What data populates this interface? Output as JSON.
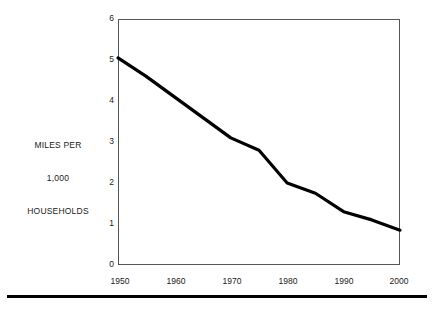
{
  "chart_data": {
    "type": "line",
    "title": "",
    "subtitle": "",
    "xlabel": "",
    "ylabel": "MILES PER 1,000 HOUSEHOLDS",
    "ylabel_lines": [
      "MILES PER",
      "1,000",
      "HOUSEHOLDS"
    ],
    "x": [
      1950,
      1955,
      1960,
      1965,
      1970,
      1975,
      1980,
      1985,
      1990,
      1995,
      2000
    ],
    "values": [
      5.05,
      4.6,
      4.1,
      3.6,
      3.1,
      2.8,
      2.0,
      1.75,
      1.3,
      1.1,
      0.85
    ],
    "series": [
      {
        "name": "Miles per 1,000 households",
        "color": "#000000",
        "values": [
          5.05,
          4.6,
          4.1,
          3.6,
          3.1,
          2.8,
          2.0,
          1.75,
          1.3,
          1.1,
          0.85
        ]
      }
    ],
    "xlim": [
      1950,
      2000
    ],
    "ylim": [
      0,
      6
    ],
    "xticks": [
      1950,
      1960,
      1970,
      1980,
      1990,
      2000
    ],
    "xtick_labels": [
      "1950",
      "1960",
      "1970",
      "1980",
      "1990",
      "2000"
    ],
    "yticks": [
      0,
      1,
      2,
      3,
      4,
      5,
      6
    ],
    "ytick_labels": [
      "0",
      "1",
      "2",
      "3",
      "4",
      "5",
      "6"
    ],
    "grid": false,
    "legend": "none",
    "line_color": "#000000",
    "frame_color": "#555555",
    "background": "#ffffff"
  },
  "figure": {
    "bottom_rule_color": "#000000"
  }
}
